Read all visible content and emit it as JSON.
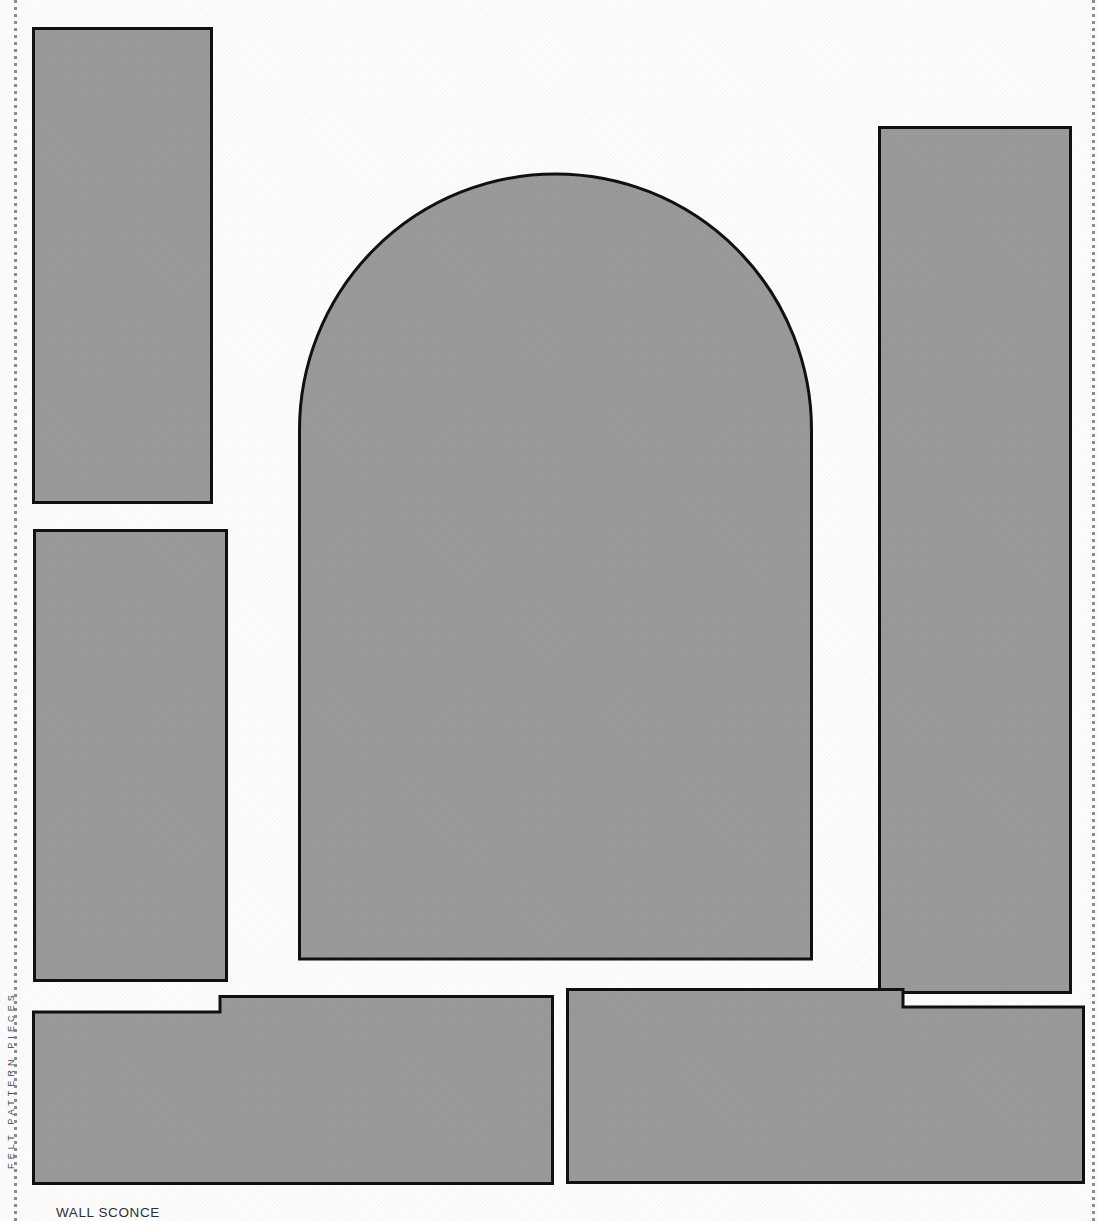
{
  "sheet": {
    "width": 1098,
    "height": 1221,
    "background_color": "#fdfdfd",
    "piece_fill_color": "#9a9a9a",
    "piece_outline_color": "#111111",
    "margin_rule_color": "#8d8d8d"
  },
  "captions": {
    "bottom_label": "WALL SCONCE",
    "margin_label": "FELT PATTERN PIECES"
  },
  "pieces": [
    {
      "id": "panel-top-left",
      "label": "top left side panel",
      "shape": "rectangle",
      "x": 32,
      "y": 27,
      "width": 181,
      "height": 477
    },
    {
      "id": "panel-bottom-left",
      "label": "lower left side panel",
      "shape": "rectangle",
      "x": 33,
      "y": 529,
      "width": 195,
      "height": 453
    },
    {
      "id": "panel-arch-center",
      "label": "arched front panel",
      "shape": "arch",
      "x": 298,
      "y": 171,
      "width": 515,
      "height": 788,
      "arch_radius": 258
    },
    {
      "id": "panel-right-tall",
      "label": "right side panel",
      "shape": "rectangle",
      "x": 878,
      "y": 126,
      "width": 194,
      "height": 868
    },
    {
      "id": "base-left",
      "label": "left base piece with notch",
      "shape": "notched",
      "x": 32,
      "y": 995,
      "width": 522,
      "height": 183,
      "notch_x": 220,
      "notch_depth": 17
    },
    {
      "id": "base-right",
      "label": "right base piece with notch",
      "shape": "notched",
      "x": 566,
      "y": 988,
      "width": 519,
      "height": 196,
      "notch_x": 903,
      "notch_depth": 18
    }
  ]
}
